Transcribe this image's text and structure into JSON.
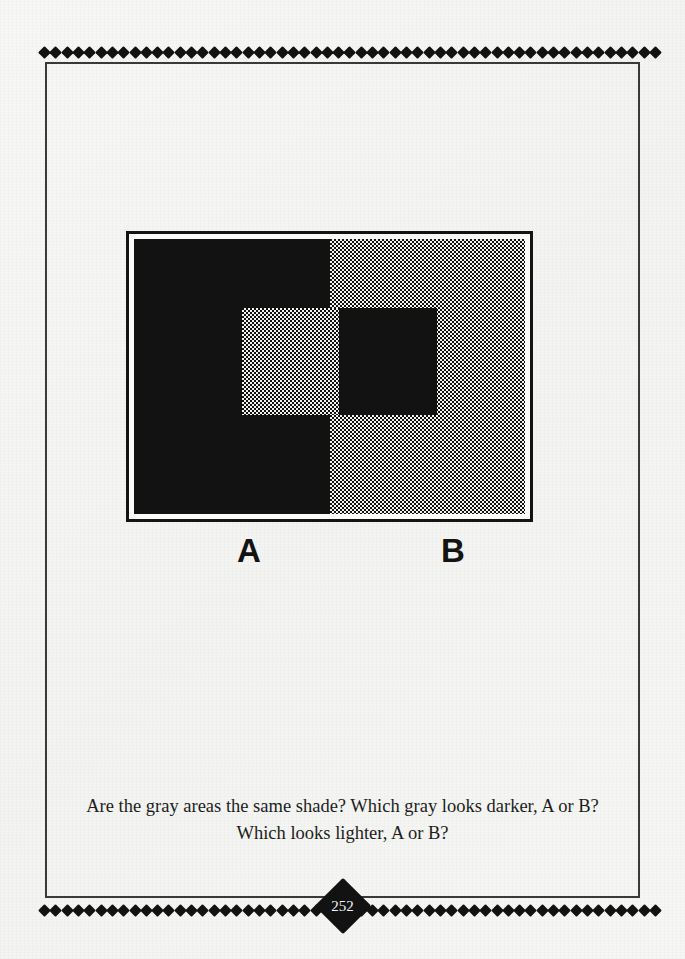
{
  "page": {
    "page_number": "252",
    "background_color": "#f5f5f3",
    "ink_color": "#121212"
  },
  "ornament": {
    "icon": "diamond-icon",
    "top_count": 55,
    "bottom_count": 55,
    "center_marker_icon": "diamond-page-marker-icon"
  },
  "figure": {
    "name": "simultaneous-contrast-illusion",
    "frame_border_color": "#141414",
    "panels": [
      {
        "id": "A",
        "side": "left",
        "background_fill": "solid-black",
        "background_color": "#121212",
        "inner_square_fill": "halftone-gray",
        "inner_square_color": "#f3f3f0"
      },
      {
        "id": "B",
        "side": "right",
        "background_fill": "halftone-gray",
        "background_color": "#f3f3f0",
        "inner_square_fill": "solid-black",
        "inner_square_color": "#121212"
      }
    ],
    "labels": {
      "left": "A",
      "right": "B"
    }
  },
  "caption": {
    "line1": "Are the gray areas the same shade? Which gray looks darker, A or B?",
    "line2": "Which looks lighter, A or B?"
  }
}
